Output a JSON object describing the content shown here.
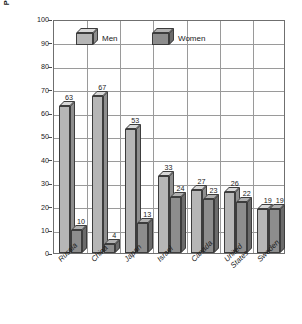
{
  "chart_data": {
    "type": "bar",
    "title": "",
    "subtitle": "",
    "xlabel": "",
    "ylabel_lines": [
      "Percentage of Men and Women, Ages Fifteen and",
      "Older, Who Smoke Cigarettes"
    ],
    "ylim": [
      0,
      100
    ],
    "yticks": [
      0,
      10,
      20,
      30,
      40,
      50,
      60,
      70,
      80,
      90,
      100
    ],
    "grid": "horizontal-and-vertical",
    "legend_position": "inside-top-left",
    "categories": [
      "Russia",
      "China",
      "Japan",
      "Israel",
      "Canada",
      "United States",
      "Sweden"
    ],
    "category_label_lines": [
      [
        "Russia"
      ],
      [
        "China"
      ],
      [
        "Japan"
      ],
      [
        "Israel"
      ],
      [
        "Canada"
      ],
      [
        "United",
        "States"
      ],
      [
        "Sweden"
      ]
    ],
    "series": [
      {
        "name": "Men",
        "color": "#b6b6b6",
        "values": [
          63,
          67,
          53,
          33,
          27,
          26,
          19
        ]
      },
      {
        "name": "Women",
        "color": "#8d8d8d",
        "values": [
          10,
          4,
          13,
          24,
          23,
          22,
          19
        ]
      }
    ]
  },
  "legend": {
    "items": [
      {
        "label": "Men",
        "key": "men"
      },
      {
        "label": "Women",
        "key": "women"
      }
    ]
  },
  "colors": {
    "men_front": "#b6b6b6",
    "women_front": "#8d8d8d",
    "grid": "#9a9a9a",
    "frame": "#6f6f6f",
    "text": "#1a1a1a",
    "background": "#ffffff"
  }
}
